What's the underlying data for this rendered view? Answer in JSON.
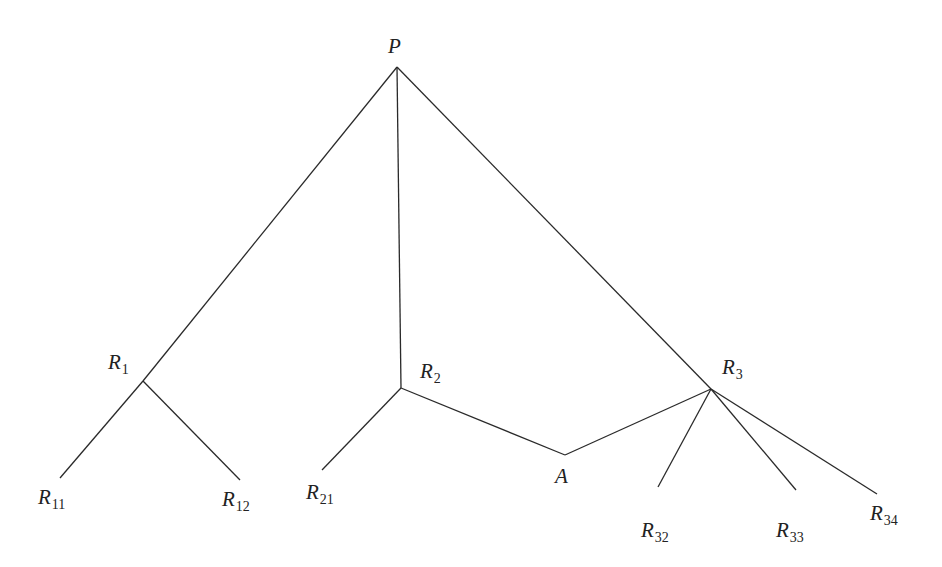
{
  "diagram": {
    "type": "tree-network",
    "nodes": [
      {
        "id": "P",
        "base": "P",
        "sub": "",
        "x": 397,
        "y": 67,
        "label_x": 388,
        "label_y": 36
      },
      {
        "id": "R1",
        "base": "R",
        "sub": "1",
        "x": 143,
        "y": 381,
        "label_x": 108,
        "label_y": 352
      },
      {
        "id": "R11",
        "base": "R",
        "sub": "11",
        "x": 60,
        "y": 478,
        "label_x": 38,
        "label_y": 487
      },
      {
        "id": "R12",
        "base": "R",
        "sub": "12",
        "x": 240,
        "y": 480,
        "label_x": 222,
        "label_y": 489
      },
      {
        "id": "R2",
        "base": "R",
        "sub": "2",
        "x": 401,
        "y": 388,
        "label_x": 420,
        "label_y": 361
      },
      {
        "id": "R21",
        "base": "R",
        "sub": "21",
        "x": 322,
        "y": 470,
        "label_x": 306,
        "label_y": 482
      },
      {
        "id": "A",
        "base": "A",
        "sub": "",
        "x": 565,
        "y": 455,
        "label_x": 555,
        "label_y": 466
      },
      {
        "id": "R3",
        "base": "R",
        "sub": "3",
        "x": 711,
        "y": 389,
        "label_x": 722,
        "label_y": 357
      },
      {
        "id": "R32",
        "base": "R",
        "sub": "32",
        "x": 658,
        "y": 487,
        "label_x": 641,
        "label_y": 520
      },
      {
        "id": "R33",
        "base": "R",
        "sub": "33",
        "x": 796,
        "y": 490,
        "label_x": 776,
        "label_y": 520
      },
      {
        "id": "R34",
        "base": "R",
        "sub": "34",
        "x": 877,
        "y": 494,
        "label_x": 870,
        "label_y": 503
      }
    ],
    "edges": [
      [
        "P",
        "R1"
      ],
      [
        "P",
        "R2"
      ],
      [
        "P",
        "R3"
      ],
      [
        "R1",
        "R11"
      ],
      [
        "R1",
        "R12"
      ],
      [
        "R2",
        "R21"
      ],
      [
        "R2",
        "A"
      ],
      [
        "A",
        "R3"
      ],
      [
        "R3",
        "R32"
      ],
      [
        "R3",
        "R33"
      ],
      [
        "R3",
        "R34"
      ]
    ],
    "edge_color": "#2a2a2a"
  },
  "labels": {
    "P": {
      "base": "P",
      "sub": ""
    },
    "R1": {
      "base": "R",
      "sub": "1"
    },
    "R11": {
      "base": "R",
      "sub": "11"
    },
    "R12": {
      "base": "R",
      "sub": "12"
    },
    "R2": {
      "base": "R",
      "sub": "2"
    },
    "R21": {
      "base": "R",
      "sub": "21"
    },
    "A": {
      "base": "A",
      "sub": ""
    },
    "R3": {
      "base": "R",
      "sub": "3"
    },
    "R32": {
      "base": "R",
      "sub": "32"
    },
    "R33": {
      "base": "R",
      "sub": "33"
    },
    "R34": {
      "base": "R",
      "sub": "34"
    }
  }
}
